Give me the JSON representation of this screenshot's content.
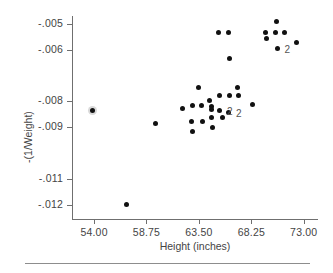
{
  "chart_data": {
    "type": "scatter",
    "title": "",
    "xlabel": "Height (inches)",
    "ylabel": "-(1/Weight)",
    "xlim": [
      52.0,
      74.2
    ],
    "ylim": [
      -0.01255,
      -0.0047
    ],
    "grid": false,
    "legend": null,
    "xticks": [
      54.0,
      58.75,
      63.5,
      68.25,
      73.0
    ],
    "xticklabels": [
      "54.00",
      "58.75",
      "63.50",
      "68.25",
      "73.00"
    ],
    "yticks": [
      -0.005,
      -0.006,
      -0.008,
      -0.009,
      -0.011,
      -0.012
    ],
    "yticklabels": [
      "-.005",
      "-.006",
      "-.008",
      "-.009",
      "-.011",
      "-.012"
    ],
    "marker": "filled-circle",
    "marker_color": "#111111",
    "points": [
      {
        "x": 53.9,
        "y": -0.00835,
        "n": 2,
        "overlap": true
      },
      {
        "x": 56.9,
        "y": -0.012,
        "n": 1
      },
      {
        "x": 59.6,
        "y": -0.00885,
        "n": 1
      },
      {
        "x": 62.0,
        "y": -0.00828,
        "n": 1
      },
      {
        "x": 62.9,
        "y": -0.00815,
        "n": 1
      },
      {
        "x": 62.8,
        "y": -0.00878,
        "n": 1
      },
      {
        "x": 62.9,
        "y": -0.00918,
        "n": 1
      },
      {
        "x": 63.5,
        "y": -0.00745,
        "n": 1
      },
      {
        "x": 63.7,
        "y": -0.00818,
        "n": 1
      },
      {
        "x": 63.8,
        "y": -0.00878,
        "n": 1
      },
      {
        "x": 64.5,
        "y": -0.00795,
        "n": 1
      },
      {
        "x": 64.6,
        "y": -0.0082,
        "n": 1
      },
      {
        "x": 64.6,
        "y": -0.00832,
        "n": 1
      },
      {
        "x": 64.6,
        "y": -0.00863,
        "n": 1
      },
      {
        "x": 64.7,
        "y": -0.00903,
        "n": 1
      },
      {
        "x": 65.3,
        "y": -0.00535,
        "n": 1
      },
      {
        "x": 65.4,
        "y": -0.00778,
        "n": 1
      },
      {
        "x": 65.4,
        "y": -0.00835,
        "n": 2,
        "label": "2"
      },
      {
        "x": 65.6,
        "y": -0.00862,
        "n": 1
      },
      {
        "x": 66.2,
        "y": -0.00535,
        "n": 1
      },
      {
        "x": 66.3,
        "y": -0.00633,
        "n": 1
      },
      {
        "x": 66.3,
        "y": -0.00778,
        "n": 1
      },
      {
        "x": 66.2,
        "y": -0.00843,
        "n": 2,
        "label": "2"
      },
      {
        "x": 67.0,
        "y": -0.00745,
        "n": 1
      },
      {
        "x": 67.1,
        "y": -0.00778,
        "n": 1
      },
      {
        "x": 68.4,
        "y": -0.00812,
        "n": 1
      },
      {
        "x": 69.5,
        "y": -0.00535,
        "n": 1
      },
      {
        "x": 69.6,
        "y": -0.00558,
        "n": 1
      },
      {
        "x": 70.4,
        "y": -0.00535,
        "n": 1
      },
      {
        "x": 70.5,
        "y": -0.0049,
        "n": 1
      },
      {
        "x": 70.6,
        "y": -0.00595,
        "n": 2,
        "label": "2"
      },
      {
        "x": 71.3,
        "y": -0.00535,
        "n": 1
      },
      {
        "x": 72.3,
        "y": -0.00572,
        "n": 1
      }
    ],
    "overplot_labels": [
      {
        "x": 65.4,
        "y": -0.00835,
        "text": "2"
      },
      {
        "x": 66.2,
        "y": -0.00843,
        "text": "2"
      },
      {
        "x": 70.6,
        "y": -0.00595,
        "text": "2"
      }
    ]
  },
  "axes": {
    "x_title": "Height (inches)",
    "y_title": "-(1/Weight)"
  }
}
